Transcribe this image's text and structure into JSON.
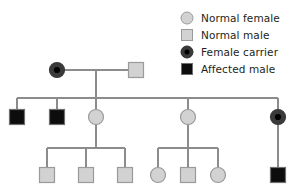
{
  "figure": {
    "kind": "pedigree-chart"
  },
  "colors": {
    "normal_fill": "#d2d2d2",
    "normal_stroke": "#9a9a9a",
    "carrier_fill": "#3a3a3a",
    "carrier_dot": "#000000",
    "affected_fill": "#0d0d0d",
    "affected_stroke": "#6f6f6f",
    "line": "#8c8c8c",
    "text": "#231f20",
    "background": "#ffffff"
  },
  "legend": {
    "items": [
      {
        "label": "Normal female",
        "symbol": "circle-light-gray",
        "swatch_class": "sw-circle-normal",
        "icon_name": "normal-female-symbol-icon"
      },
      {
        "label": "Normal male",
        "symbol": "square-light-gray",
        "swatch_class": "sw-square-normal",
        "icon_name": "normal-male-symbol-icon"
      },
      {
        "label": "Female carrier",
        "symbol": "circle-dark-with-center-dot",
        "swatch_class": "sw-circle-carrier",
        "icon_name": "female-carrier-symbol-icon"
      },
      {
        "label": "Affected male",
        "symbol": "square-black",
        "swatch_class": "sw-square-affected",
        "icon_name": "affected-male-symbol-icon"
      }
    ]
  },
  "pedigree": {
    "generations": [
      {
        "id": "generation-1",
        "y": 70,
        "individuals": [
          {
            "id": "I-1",
            "x": 57,
            "sex": "female",
            "status": "carrier",
            "name": "female-carrier"
          },
          {
            "id": "I-2",
            "x": 136,
            "sex": "male",
            "status": "normal",
            "name": "normal-male"
          }
        ]
      },
      {
        "id": "generation-2",
        "y": 117,
        "individuals": [
          {
            "id": "II-1",
            "x": 17,
            "sex": "male",
            "status": "affected",
            "name": "affected-male"
          },
          {
            "id": "II-2",
            "x": 57,
            "sex": "male",
            "status": "affected",
            "name": "affected-male"
          },
          {
            "id": "II-3",
            "x": 96,
            "sex": "female",
            "status": "normal",
            "name": "normal-female"
          },
          {
            "id": "II-4",
            "x": 188,
            "sex": "female",
            "status": "normal",
            "name": "normal-female"
          },
          {
            "id": "II-5",
            "x": 278,
            "sex": "female",
            "status": "carrier",
            "name": "female-carrier"
          }
        ]
      },
      {
        "id": "generation-3",
        "y": 175,
        "individuals": [
          {
            "id": "III-1",
            "x": 47,
            "sex": "male",
            "status": "normal",
            "name": "normal-male"
          },
          {
            "id": "III-2",
            "x": 86,
            "sex": "male",
            "status": "normal",
            "name": "normal-male"
          },
          {
            "id": "III-3",
            "x": 125,
            "sex": "male",
            "status": "normal",
            "name": "normal-male"
          },
          {
            "id": "III-4",
            "x": 158,
            "sex": "female",
            "status": "normal",
            "name": "normal-female"
          },
          {
            "id": "III-5",
            "x": 188,
            "sex": "male",
            "status": "normal",
            "name": "normal-male"
          },
          {
            "id": "III-6",
            "x": 218,
            "sex": "female",
            "status": "normal",
            "name": "normal-female"
          },
          {
            "id": "III-7",
            "x": 278,
            "sex": "male",
            "status": "affected",
            "name": "affected-male"
          }
        ]
      }
    ],
    "connectors": {
      "mating_line_gen1": {
        "x1": 57,
        "x2": 136,
        "y": 70
      },
      "descent_gen1": {
        "x": 96,
        "y1": 70,
        "y2": 98
      },
      "sibship_gen2": {
        "x1": 17,
        "x2": 278,
        "y": 98
      },
      "sibship_gen3_left": {
        "x1": 47,
        "x2": 125,
        "y": 148
      },
      "sibship_gen3_right": {
        "x1": 158,
        "x2": 218,
        "y": 148
      },
      "descent_gen2_left": {
        "x": 96,
        "y1": 117,
        "y2": 148
      },
      "descent_gen2_right": {
        "x": 188,
        "y1": 117,
        "y2": 148
      },
      "descent_gen2_far_right": {
        "x": 278,
        "y1": 117,
        "y2": 175
      }
    }
  }
}
